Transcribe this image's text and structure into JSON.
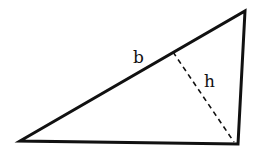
{
  "diagram": {
    "type": "triangle with altitude",
    "labels": {
      "side": "b",
      "altitude": "h"
    },
    "vertices": {
      "bottom_left": [
        20,
        141
      ],
      "top_right": [
        245,
        11
      ],
      "bottom_right": [
        238,
        144
      ]
    },
    "altitude_foot": [
      173,
      52
    ],
    "colors": {
      "stroke": "#111111",
      "background": "#ffffff"
    }
  }
}
